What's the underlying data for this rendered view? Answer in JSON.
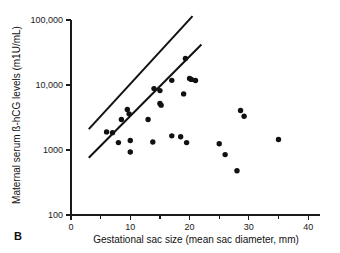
{
  "figure": {
    "panel_label": "B"
  },
  "chart_data": {
    "type": "scatter",
    "title": "",
    "xlabel": "Gestational sac size (mean sac diameter, mm)",
    "ylabel": "Maternal serum ß-hCG levels (m1U/mL)",
    "xlim": [
      0,
      42
    ],
    "ylim": [
      100,
      100000
    ],
    "yscale": "log",
    "grid": false,
    "legend": "none",
    "xticks_major": [
      0,
      10,
      20,
      30,
      40
    ],
    "xticks_major_labels": [
      "0",
      "10",
      "20",
      "30",
      "40"
    ],
    "xticks_minor": [
      5,
      15,
      25,
      35
    ],
    "yticks": [
      100,
      1000,
      10000,
      100000
    ],
    "ytick_labels": [
      "100",
      "1000",
      "10,000",
      "100,000"
    ],
    "points": [
      {
        "x": 6.0,
        "y": 1900
      },
      {
        "x": 7.0,
        "y": 1850
      },
      {
        "x": 8.0,
        "y": 1300
      },
      {
        "x": 8.5,
        "y": 2950
      },
      {
        "x": 9.5,
        "y": 4200
      },
      {
        "x": 9.8,
        "y": 3600
      },
      {
        "x": 10.0,
        "y": 1400
      },
      {
        "x": 10.0,
        "y": 930
      },
      {
        "x": 13.0,
        "y": 2950
      },
      {
        "x": 13.8,
        "y": 1330
      },
      {
        "x": 14.0,
        "y": 8800
      },
      {
        "x": 15.0,
        "y": 8200
      },
      {
        "x": 15.0,
        "y": 5200
      },
      {
        "x": 15.2,
        "y": 4900
      },
      {
        "x": 17.0,
        "y": 11800
      },
      {
        "x": 17.0,
        "y": 1650
      },
      {
        "x": 18.5,
        "y": 1600
      },
      {
        "x": 19.0,
        "y": 7300
      },
      {
        "x": 19.3,
        "y": 25500
      },
      {
        "x": 19.5,
        "y": 1300
      },
      {
        "x": 20.0,
        "y": 12600
      },
      {
        "x": 20.3,
        "y": 12200
      },
      {
        "x": 21.0,
        "y": 11700
      },
      {
        "x": 25.0,
        "y": 1250
      },
      {
        "x": 26.0,
        "y": 850
      },
      {
        "x": 28.0,
        "y": 480
      },
      {
        "x": 28.6,
        "y": 4050
      },
      {
        "x": 29.2,
        "y": 3300
      },
      {
        "x": 35.0,
        "y": 1450
      }
    ],
    "reference_lines": [
      {
        "name": "upper-bound-line",
        "x1": 3.0,
        "y1": 2100,
        "x2": 20.5,
        "y2": 115000
      },
      {
        "name": "lower-bound-line",
        "x1": 3.0,
        "y1": 760,
        "x2": 22.0,
        "y2": 42000
      }
    ]
  }
}
